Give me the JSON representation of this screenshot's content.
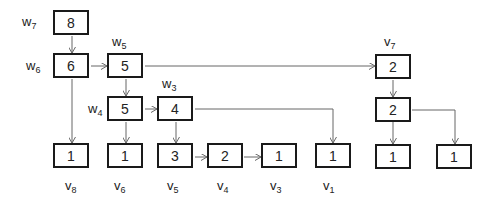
{
  "nodes": [
    {
      "id": "w7",
      "value": "8",
      "label": "w",
      "sub": "7"
    },
    {
      "id": "w6",
      "value": "6",
      "label": "w",
      "sub": "6"
    },
    {
      "id": "w5",
      "value": "5",
      "label": "w",
      "sub": "5"
    },
    {
      "id": "w4",
      "value": "5",
      "label": "w",
      "sub": "4"
    },
    {
      "id": "w3",
      "value": "4",
      "label": "w",
      "sub": "3"
    },
    {
      "id": "v7",
      "value": "2",
      "label": "v",
      "sub": "7"
    },
    {
      "id": "v7b",
      "value": "2"
    },
    {
      "id": "v8",
      "value": "1",
      "label": "v",
      "sub": "8"
    },
    {
      "id": "v6",
      "value": "1",
      "label": "v",
      "sub": "6"
    },
    {
      "id": "v5",
      "value": "3",
      "label": "v",
      "sub": "5"
    },
    {
      "id": "v4",
      "value": "2",
      "label": "v",
      "sub": "4"
    },
    {
      "id": "v3",
      "value": "1",
      "label": "v",
      "sub": "3"
    },
    {
      "id": "v1",
      "value": "1",
      "label": "v",
      "sub": "1"
    },
    {
      "id": "r1",
      "value": "1"
    },
    {
      "id": "r2",
      "value": "1"
    }
  ],
  "edge_color": "#666666"
}
